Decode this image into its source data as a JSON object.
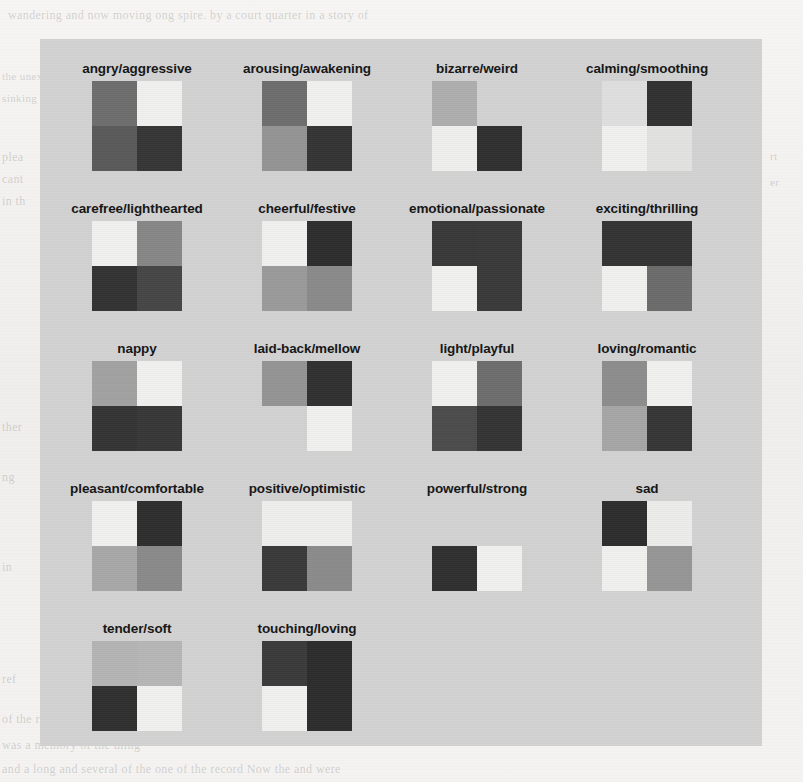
{
  "figure": {
    "type": "heatmap-grid",
    "panel_background": "#d2d2d2",
    "page_background": "#f3f2f0",
    "label_color": "#161616",
    "columns": 4,
    "rows": 5,
    "quadrant_order": [
      "top-left",
      "top-right",
      "bottom-left",
      "bottom-right"
    ],
    "palette": {
      "black": "#2a2a2a",
      "dark": "#3b3b3b",
      "darkgray": "#4a4a4a",
      "midgray": "#767676",
      "gray": "#8a8a8a",
      "lightgray": "#a8a8a8",
      "paleglay": "#bcbcbc",
      "background": "#d2d2d2",
      "offwhite": "#e8e8e6",
      "white": "#f2f2f0"
    }
  },
  "ghost_text": [
    {
      "x": 8,
      "y": 8,
      "text": "wandering and now moving  ong spire.  by a court quarter in a story of",
      "size": 12
    },
    {
      "x": 2,
      "y": 70,
      "text": "the unexpected appearance of the",
      "size": 11
    },
    {
      "x": 2,
      "y": 92,
      "text": "sinking of the tone in which the",
      "size": 11
    },
    {
      "x": 2,
      "y": 150,
      "text": "plea",
      "size": 12
    },
    {
      "x": 2,
      "y": 172,
      "text": "cant",
      "size": 12
    },
    {
      "x": 2,
      "y": 194,
      "text": "in th",
      "size": 12
    },
    {
      "x": 770,
      "y": 150,
      "text": "rt",
      "size": 11
    },
    {
      "x": 770,
      "y": 176,
      "text": "er",
      "size": 11
    },
    {
      "x": 2,
      "y": 420,
      "text": "ther",
      "size": 12
    },
    {
      "x": 2,
      "y": 470,
      "text": "ng",
      "size": 12
    },
    {
      "x": 2,
      "y": 560,
      "text": "in",
      "size": 12
    },
    {
      "x": 2,
      "y": 672,
      "text": "ref",
      "size": 12
    },
    {
      "x": 2,
      "y": 712,
      "text": "of the rest",
      "size": 12
    },
    {
      "x": 2,
      "y": 738,
      "text": "was a memory of the thing",
      "size": 12
    },
    {
      "x": 2,
      "y": 762,
      "text": "and a long  and several  of the  one of the record Now  the  and were",
      "size": 12
    }
  ],
  "cells": [
    {
      "label": "angry/aggressive",
      "row": 0,
      "col": 0,
      "quadrants": [
        "#6e6e6e",
        "#f0f0ee",
        "#5a5a5a",
        "#363636"
      ]
    },
    {
      "label": "arousing/awakening",
      "row": 0,
      "col": 1,
      "quadrants": [
        "#6e6e6e",
        "#f0f0ee",
        "#949494",
        "#353535"
      ]
    },
    {
      "label": "bizarre/weird",
      "row": 0,
      "col": 2,
      "quadrants": [
        "#aeaeae",
        "#d2d2d2",
        "#efefed",
        "#303030"
      ]
    },
    {
      "label": "calming/smoothing",
      "row": 0,
      "col": 3,
      "quadrants": [
        "#dedede",
        "#323232",
        "#f0f0ee",
        "#e2e2e0"
      ]
    },
    {
      "label": "carefree/lighthearted",
      "row": 1,
      "col": 0,
      "quadrants": [
        "#f0f0ee",
        "#878787",
        "#333333",
        "#464646"
      ]
    },
    {
      "label": "cheerful/festive",
      "row": 1,
      "col": 1,
      "quadrants": [
        "#f0f0ee",
        "#2e2e2e",
        "#9a9a9a",
        "#8a8a8a"
      ]
    },
    {
      "label": "emotional/passionate",
      "row": 1,
      "col": 2,
      "quadrants": [
        "#393939",
        "#3a3a3a",
        "#f0f0ee",
        "#3a3a3a"
      ]
    },
    {
      "label": "exciting/thrilling",
      "row": 1,
      "col": 3,
      "quadrants": [
        "#343434",
        "#343434",
        "#f0f0ee",
        "#6c6c6c"
      ]
    },
    {
      "label": "nappy",
      "row": 2,
      "col": 0,
      "quadrants": [
        "#a2a2a2",
        "#f0f0ee",
        "#353535",
        "#383838"
      ]
    },
    {
      "label": "laid-back/mellow",
      "row": 2,
      "col": 1,
      "quadrants": [
        "#949494",
        "#313131",
        "#d2d2d2",
        "#f0f0ee"
      ]
    },
    {
      "label": "light/playful",
      "row": 2,
      "col": 2,
      "quadrants": [
        "#f0f0ee",
        "#6e6e6e",
        "#4c4c4c",
        "#353535"
      ]
    },
    {
      "label": "loving/romantic",
      "row": 2,
      "col": 3,
      "quadrants": [
        "#8d8d8d",
        "#f0f0ee",
        "#a6a6a6",
        "#363636"
      ]
    },
    {
      "label": "pleasant/comfortable",
      "row": 3,
      "col": 0,
      "quadrants": [
        "#f0f0ee",
        "#2f2f2f",
        "#a8a8a8",
        "#8a8a8a"
      ]
    },
    {
      "label": "positive/optimistic",
      "row": 3,
      "col": 1,
      "quadrants": [
        "#eeeeec",
        "#eeeeec",
        "#3a3a3a",
        "#8b8b8b"
      ]
    },
    {
      "label": "powerful/strong",
      "row": 3,
      "col": 2,
      "quadrants": [
        "#d2d2d2",
        "#d2d2d2",
        "#303030",
        "#f0f0ee"
      ]
    },
    {
      "label": "sad",
      "row": 3,
      "col": 3,
      "quadrants": [
        "#2e2e2e",
        "#ececea",
        "#f0f0ee",
        "#969696"
      ]
    },
    {
      "label": "tender/soft",
      "row": 4,
      "col": 0,
      "quadrants": [
        "#b4b4b4",
        "#b6b6b6",
        "#303030",
        "#f0f0ee"
      ]
    },
    {
      "label": "touching/loving",
      "row": 4,
      "col": 1,
      "quadrants": [
        "#3b3b3b",
        "#2d2d2d",
        "#f0f0ee",
        "#2d2d2d"
      ]
    }
  ]
}
